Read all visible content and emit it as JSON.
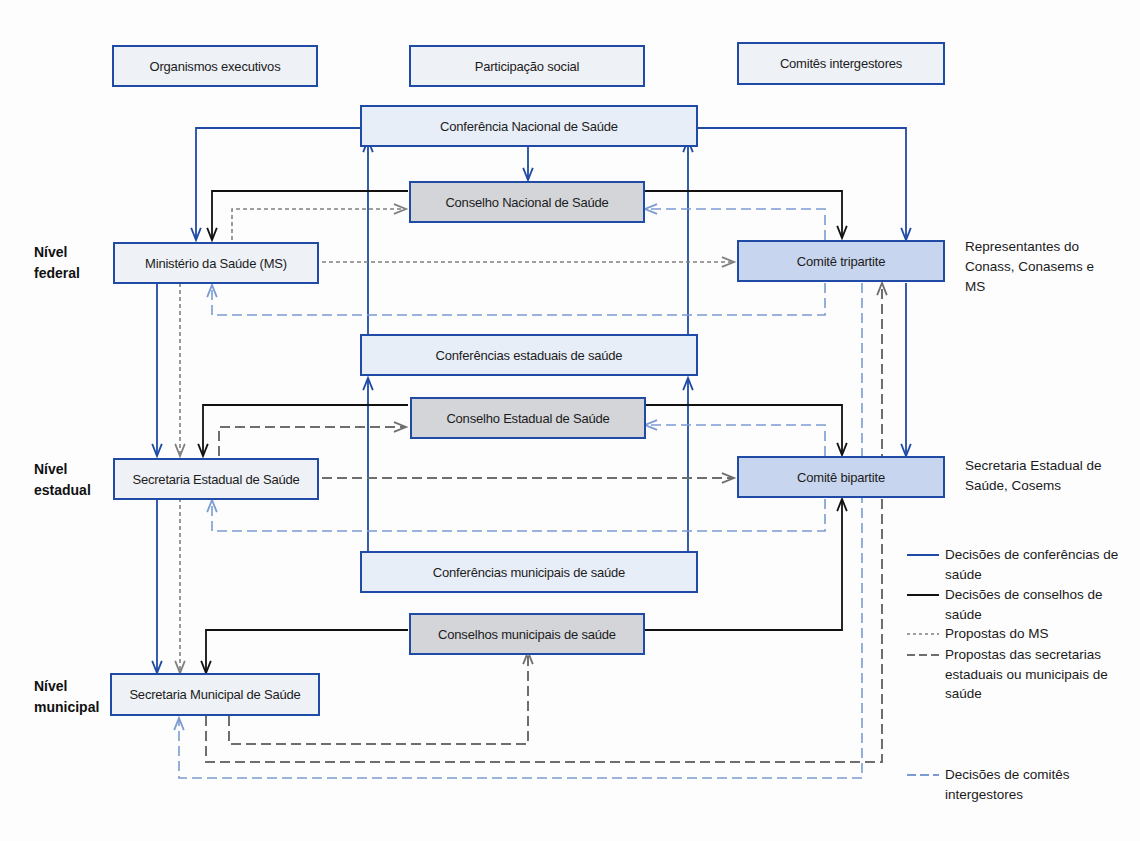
{
  "colors": {
    "conference": "#1f4aa5",
    "council": "#111111",
    "ms_proposal": "#808080",
    "secretariat_proposal": "#6e6e6e",
    "committee": "#7b9bd2",
    "node_border": "#1f4aa5"
  },
  "headers": {
    "executive": "Organismos executivos",
    "social": "Participação social",
    "committees": "Comitês intergestores"
  },
  "levels": {
    "federal": "Nível federal",
    "state": "Nível estadual",
    "municipal": "Nível municipal"
  },
  "nodes": {
    "ms": "Ministério da Saúde (MS)",
    "ses": "Secretaria Estadual de Saúde",
    "sms": "Secretaria Municipal de Saúde",
    "cns_conf": "Conferência Nacional de Saúde",
    "cns": "Conselho Nacional de Saúde",
    "ces_conf": "Conferências estaduais de saúde",
    "ces": "Conselho Estadual de Saúde",
    "cms_conf": "Conferências municipais de saúde",
    "cms": "Conselhos municipais de saúde",
    "cit": "Comitê tripartite",
    "cib": "Comitê bipartite"
  },
  "notes": {
    "cit": "Representantes do Conass, Conasems e MS",
    "cib": "Secretaria Estadual de Saúde, Cosems"
  },
  "legend": [
    {
      "key": "conference",
      "label": "Decisões de conferências de saúde"
    },
    {
      "key": "council",
      "label": "Decisões de conselhos de saúde"
    },
    {
      "key": "ms_proposal",
      "label": "Propostas do MS"
    },
    {
      "key": "secretariat_proposal",
      "label": "Propostas das secretarias estaduais ou municipais de saúde"
    },
    {
      "key": "committee",
      "label": "Decisões de comitês intergestores"
    }
  ],
  "edges": [
    {
      "type": "conference",
      "points": [
        [
          364,
          128
        ],
        [
          196,
          128
        ],
        [
          196,
          240
        ]
      ]
    },
    {
      "type": "conference",
      "points": [
        [
          528,
          140
        ],
        [
          528,
          180
        ]
      ]
    },
    {
      "type": "conference",
      "points": [
        [
          696,
          128
        ],
        [
          906,
          128
        ],
        [
          906,
          240
        ]
      ]
    },
    {
      "type": "conference",
      "points": [
        [
          368,
          335
        ],
        [
          368,
          140
        ]
      ]
    },
    {
      "type": "conference",
      "points": [
        [
          688,
          335
        ],
        [
          688,
          140
        ]
      ]
    },
    {
      "type": "conference",
      "points": [
        [
          368,
          552
        ],
        [
          368,
          378
        ]
      ]
    },
    {
      "type": "conference",
      "points": [
        [
          688,
          552
        ],
        [
          688,
          378
        ]
      ]
    },
    {
      "type": "conference",
      "points": [
        [
          906,
          283
        ],
        [
          906,
          456
        ]
      ]
    },
    {
      "type": "conference",
      "points": [
        [
          157,
          283
        ],
        [
          157,
          456
        ]
      ]
    },
    {
      "type": "conference",
      "points": [
        [
          157,
          498
        ],
        [
          157,
          673
        ]
      ]
    },
    {
      "type": "council",
      "points": [
        [
          408,
          191
        ],
        [
          212,
          191
        ],
        [
          212,
          240
        ]
      ]
    },
    {
      "type": "council",
      "points": [
        [
          642,
          191
        ],
        [
          842,
          191
        ],
        [
          842,
          238
        ]
      ]
    },
    {
      "type": "council",
      "points": [
        [
          408,
          405
        ],
        [
          203,
          405
        ],
        [
          203,
          456
        ]
      ]
    },
    {
      "type": "council",
      "points": [
        [
          642,
          405
        ],
        [
          842,
          405
        ],
        [
          842,
          455
        ]
      ]
    },
    {
      "type": "council",
      "points": [
        [
          408,
          630
        ],
        [
          206,
          630
        ],
        [
          206,
          673
        ]
      ]
    },
    {
      "type": "council",
      "points": [
        [
          642,
          630
        ],
        [
          842,
          630
        ],
        [
          842,
          499
        ]
      ]
    },
    {
      "type": "ms_proposal",
      "points": [
        [
          232,
          240
        ],
        [
          232,
          209
        ],
        [
          406,
          209
        ]
      ]
    },
    {
      "type": "ms_proposal",
      "points": [
        [
          322,
          262
        ],
        [
          734,
          262
        ]
      ]
    },
    {
      "type": "ms_proposal",
      "points": [
        [
          180,
          283
        ],
        [
          180,
          456
        ]
      ]
    },
    {
      "type": "ms_proposal",
      "points": [
        [
          180,
          498
        ],
        [
          180,
          673
        ]
      ]
    },
    {
      "type": "secretariat_proposal",
      "points": [
        [
          219,
          456
        ],
        [
          219,
          427
        ],
        [
          406,
          427
        ]
      ]
    },
    {
      "type": "secretariat_proposal",
      "points": [
        [
          322,
          478
        ],
        [
          734,
          478
        ]
      ]
    },
    {
      "type": "secretariat_proposal",
      "points": [
        [
          229,
          716
        ],
        [
          229,
          744
        ],
        [
          528,
          744
        ],
        [
          528,
          652
        ]
      ]
    },
    {
      "type": "secretariat_proposal",
      "points": [
        [
          206,
          716
        ],
        [
          206,
          762
        ],
        [
          882,
          762
        ],
        [
          882,
          283
        ]
      ]
    },
    {
      "type": "committee",
      "points": [
        [
          825,
          240
        ],
        [
          825,
          209
        ],
        [
          645,
          209
        ]
      ]
    },
    {
      "type": "committee",
      "points": [
        [
          825,
          283
        ],
        [
          825,
          315
        ],
        [
          212,
          315
        ],
        [
          212,
          285
        ]
      ]
    },
    {
      "type": "committee",
      "points": [
        [
          825,
          456
        ],
        [
          825,
          425
        ],
        [
          645,
          425
        ]
      ]
    },
    {
      "type": "committee",
      "points": [
        [
          825,
          499
        ],
        [
          825,
          531
        ],
        [
          212,
          531
        ],
        [
          212,
          500
        ]
      ]
    },
    {
      "type": "committee",
      "points": [
        [
          862,
          283
        ],
        [
          862,
          778
        ],
        [
          179,
          778
        ],
        [
          179,
          718
        ]
      ]
    }
  ]
}
